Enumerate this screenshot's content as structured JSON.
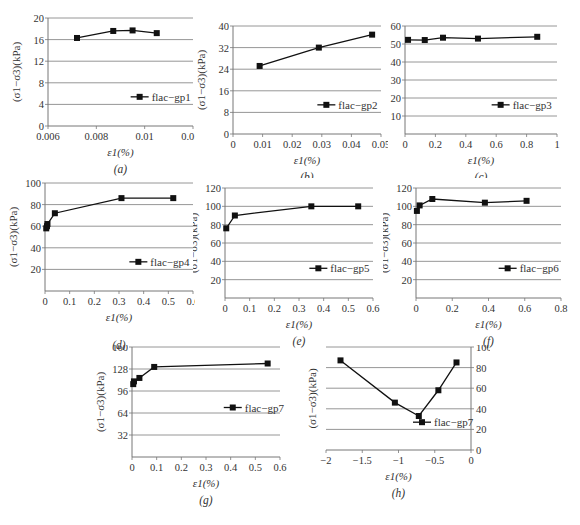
{
  "figure": {
    "y_label": "(σ1−σ3)(kPa)",
    "x_label": "ε1(%)"
  },
  "chart_data": [
    {
      "id": "a",
      "type": "line",
      "caption": "(a)",
      "xlabel": "ε1(%)",
      "ylabel": "(σ1−σ3)(kPa)",
      "xlim": [
        0.006,
        0.012
      ],
      "ylim": [
        0,
        20
      ],
      "xticks": [
        0.006,
        0.008,
        0.01,
        0.012
      ],
      "xtick_labels": [
        "0.006",
        "0.008",
        "0.01",
        "0.012"
      ],
      "yticks": [
        0,
        4,
        8,
        12,
        16,
        20
      ],
      "ytick_labels": [
        "0",
        "4",
        "8",
        "12",
        "16",
        "20"
      ],
      "grid": "horizontal",
      "legend_position": "lower right",
      "series": [
        {
          "name": "flac−gp1",
          "x": [
            0.0072,
            0.0087,
            0.0095,
            0.0105
          ],
          "y": [
            16.3,
            17.6,
            17.7,
            17.2
          ]
        }
      ]
    },
    {
      "id": "b",
      "type": "line",
      "caption": "(b)",
      "xlabel": "ε1(%)",
      "ylabel": "(σ1−σ3)(kPa)",
      "xlim": [
        0,
        0.05
      ],
      "ylim": [
        0,
        40
      ],
      "xticks": [
        0,
        0.01,
        0.02,
        0.03,
        0.04,
        0.05
      ],
      "xtick_labels": [
        "0",
        "0.01",
        "0.02",
        "0.03",
        "0.04",
        "0.05"
      ],
      "yticks": [
        0,
        8,
        16,
        24,
        32,
        40
      ],
      "ytick_labels": [
        "0",
        "8",
        "16",
        "24",
        "32",
        "40"
      ],
      "grid": "horizontal",
      "legend_position": "lower right",
      "series": [
        {
          "name": "flac−gp2",
          "x": [
            0.009,
            0.029,
            0.047
          ],
          "y": [
            25.2,
            32.0,
            36.8
          ]
        }
      ]
    },
    {
      "id": "c",
      "type": "line",
      "caption": "(c)",
      "xlabel": "ε1(%)",
      "ylabel": "(σ1−σ3)(kPa)",
      "xlim": [
        0,
        1
      ],
      "ylim": [
        0,
        60
      ],
      "xticks": [
        0,
        0.2,
        0.4,
        0.6,
        0.8,
        1
      ],
      "xtick_labels": [
        "0",
        "0.2",
        "0.4",
        "0.6",
        "0.8",
        "1"
      ],
      "yticks": [
        10,
        20,
        30,
        40,
        50,
        60
      ],
      "ytick_labels": [
        "10",
        "20",
        "30",
        "40",
        "50",
        "60"
      ],
      "grid": "horizontal",
      "legend_position": "lower right",
      "series": [
        {
          "name": "flac−gp3",
          "x": [
            0.02,
            0.13,
            0.25,
            0.48,
            0.87
          ],
          "y": [
            52.3,
            52.2,
            53.5,
            53.0,
            54.0
          ]
        }
      ]
    },
    {
      "id": "d",
      "type": "line",
      "caption": "(d)",
      "xlabel": "ε1(%)",
      "ylabel": "(σ1−σ3)(kPa)",
      "xlim": [
        0,
        0.6
      ],
      "ylim": [
        0,
        100
      ],
      "xticks": [
        0,
        0.1,
        0.2,
        0.3,
        0.4,
        0.5,
        0.6
      ],
      "xtick_labels": [
        "0",
        "0.1",
        "0.2",
        "0.3",
        "0.4",
        "0.5",
        "0.6"
      ],
      "yticks": [
        20,
        40,
        60,
        80,
        100
      ],
      "ytick_labels": [
        "20",
        "40",
        "60",
        "80",
        "100"
      ],
      "grid": "horizontal",
      "legend_position": "lower right",
      "series": [
        {
          "name": "flac−gp4",
          "x": [
            0.005,
            0.008,
            0.01,
            0.04,
            0.31,
            0.52
          ],
          "y": [
            58,
            60,
            62,
            72,
            86,
            86
          ]
        }
      ]
    },
    {
      "id": "e",
      "type": "line",
      "caption": "(e)",
      "xlabel": "ε1(%)",
      "ylabel": "(σ1−σ3)(kPa)",
      "xlim": [
        0,
        0.6
      ],
      "ylim": [
        0,
        120
      ],
      "xticks": [
        0,
        0.1,
        0.2,
        0.3,
        0.4,
        0.5,
        0.6
      ],
      "xtick_labels": [
        "0",
        "0.1",
        "0.2",
        "0.3",
        "0.4",
        "0.5",
        "0.6"
      ],
      "yticks": [
        20,
        40,
        60,
        80,
        100,
        120
      ],
      "ytick_labels": [
        "20",
        "40",
        "60",
        "80",
        "100",
        "120"
      ],
      "grid": "horizontal",
      "legend_position": "lower right",
      "series": [
        {
          "name": "flac−gp5",
          "x": [
            0.005,
            0.04,
            0.35,
            0.54
          ],
          "y": [
            76,
            90,
            100,
            100
          ]
        }
      ]
    },
    {
      "id": "f",
      "type": "line",
      "caption": "(f)",
      "xlabel": "ε1(%)",
      "ylabel": "(σ1−σ3)(kPa)",
      "xlim": [
        0,
        0.8
      ],
      "ylim": [
        0,
        120
      ],
      "xticks": [
        0,
        0.2,
        0.4,
        0.6,
        0.8
      ],
      "xtick_labels": [
        "0",
        "0.2",
        "0.4",
        "0.6",
        "0.8"
      ],
      "yticks": [
        20,
        40,
        60,
        80,
        100,
        120
      ],
      "ytick_labels": [
        "20",
        "40",
        "60",
        "80",
        "100",
        "120"
      ],
      "grid": "horizontal",
      "legend_position": "lower right",
      "series": [
        {
          "name": "flac−gp6",
          "x": [
            0.005,
            0.02,
            0.09,
            0.38,
            0.61
          ],
          "y": [
            95,
            101,
            108,
            104,
            106
          ]
        }
      ]
    },
    {
      "id": "g",
      "type": "line",
      "caption": "(g)",
      "xlabel": "ε1(%)",
      "ylabel": "(σ1−σ3)(kPa)",
      "xlim": [
        0,
        0.6
      ],
      "ylim": [
        0,
        160
      ],
      "xticks": [
        0,
        0.1,
        0.2,
        0.3,
        0.4,
        0.5,
        0.6
      ],
      "xtick_labels": [
        "0",
        "0.1",
        "0.2",
        "0.3",
        "0.4",
        "0.5",
        "0.6"
      ],
      "yticks": [
        32,
        64,
        96,
        128,
        160
      ],
      "ytick_labels": [
        "32",
        "64",
        "96",
        "128",
        "160"
      ],
      "grid": "horizontal",
      "legend_position": "right",
      "series": [
        {
          "name": "flac−gp7",
          "x": [
            0.005,
            0.008,
            0.03,
            0.09,
            0.55
          ],
          "y": [
            106,
            110,
            115,
            131,
            136
          ]
        }
      ]
    },
    {
      "id": "h",
      "type": "line",
      "caption": "(h)",
      "xlabel": "ε1(%)",
      "ylabel": "(σ1−σ3)(kPa)",
      "y_axis_side": "right",
      "xlim": [
        -2,
        0
      ],
      "ylim": [
        0,
        100
      ],
      "xticks": [
        -2,
        -1.5,
        -1,
        -0.5,
        0
      ],
      "xtick_labels": [
        "−2",
        "−1.5",
        "−1",
        "−0.5",
        "0"
      ],
      "yticks": [
        0,
        20,
        40,
        60,
        80,
        100
      ],
      "ytick_labels": [
        "0",
        "20",
        "40",
        "60",
        "80",
        "100"
      ],
      "grid": "horizontal",
      "legend_position": "center right",
      "series": [
        {
          "name": "flac−gp7",
          "x": [
            -1.8,
            -1.05,
            -0.72,
            -0.45,
            -0.2
          ],
          "y": [
            87,
            46,
            33,
            58,
            85
          ]
        }
      ]
    }
  ]
}
